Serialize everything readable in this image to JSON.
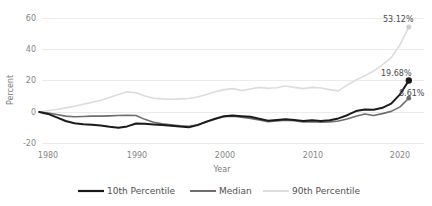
{
  "chart_data": {
    "type": "line",
    "title": "",
    "xlabel": "Year",
    "ylabel": "Percent",
    "xlim": [
      1979,
      2022
    ],
    "ylim": [
      -20,
      60
    ],
    "xticks": [
      1980,
      1990,
      2000,
      2010,
      2020
    ],
    "yticks": [
      -20,
      0,
      20,
      40,
      60
    ],
    "grid": true,
    "legend_position": "bottom",
    "x": [
      1979,
      1980,
      1981,
      1982,
      1983,
      1984,
      1985,
      1986,
      1987,
      1988,
      1989,
      1990,
      1991,
      1992,
      1993,
      1994,
      1995,
      1996,
      1997,
      1998,
      1999,
      2000,
      2001,
      2002,
      2003,
      2004,
      2005,
      2006,
      2007,
      2008,
      2009,
      2010,
      2011,
      2012,
      2013,
      2014,
      2015,
      2016,
      2017,
      2018,
      2019,
      2020,
      2021
    ],
    "series": [
      {
        "name": "10th Percentile",
        "color": "#1a1a1a",
        "width": 2.0,
        "end_label": "19.68%",
        "end_value": 19.68,
        "values": [
          0.0,
          -1.2,
          -3.4,
          -5.6,
          -7.0,
          -7.6,
          -8.0,
          -8.4,
          -9.2,
          -9.8,
          -9.0,
          -7.2,
          -7.4,
          -7.8,
          -8.2,
          -8.6,
          -9.0,
          -9.6,
          -8.2,
          -6.0,
          -4.2,
          -2.6,
          -2.2,
          -2.6,
          -3.0,
          -4.2,
          -5.4,
          -5.0,
          -4.6,
          -5.0,
          -5.6,
          -5.2,
          -5.6,
          -5.2,
          -4.0,
          -2.0,
          0.6,
          1.6,
          1.4,
          2.6,
          5.2,
          11.0,
          19.68
        ]
      },
      {
        "name": "Median",
        "color": "#6e6e6e",
        "width": 1.6,
        "end_label": "8.61%",
        "end_value": 8.61,
        "values": [
          0.0,
          -0.6,
          -1.6,
          -2.6,
          -3.0,
          -2.8,
          -2.6,
          -2.6,
          -2.4,
          -2.2,
          -2.0,
          -2.2,
          -4.6,
          -6.4,
          -7.4,
          -8.0,
          -8.6,
          -9.0,
          -8.0,
          -6.2,
          -4.4,
          -3.0,
          -2.6,
          -3.2,
          -4.0,
          -5.0,
          -6.0,
          -5.6,
          -5.2,
          -5.4,
          -6.2,
          -6.0,
          -6.4,
          -6.2,
          -5.6,
          -4.4,
          -2.6,
          -1.2,
          -2.2,
          -1.0,
          0.4,
          3.2,
          8.61
        ]
      },
      {
        "name": "90th Percentile",
        "color": "#dcdcdc",
        "width": 1.6,
        "end_label": "53.12%",
        "end_value": 53.12,
        "values": [
          0.0,
          0.8,
          1.6,
          2.6,
          3.6,
          4.8,
          6.0,
          7.4,
          9.0,
          11.0,
          12.6,
          12.0,
          10.0,
          8.6,
          8.2,
          8.0,
          8.2,
          8.4,
          9.4,
          11.0,
          12.6,
          14.0,
          14.6,
          13.4,
          14.4,
          15.4,
          14.8,
          15.2,
          16.2,
          15.4,
          14.6,
          15.4,
          15.0,
          14.0,
          13.2,
          16.8,
          20.0,
          22.6,
          25.6,
          29.4,
          34.0,
          42.0,
          53.12
        ]
      }
    ]
  },
  "legend": {
    "items": [
      {
        "label": "10th Percentile",
        "color": "#1a1a1a"
      },
      {
        "label": "Median",
        "color": "#6e6e6e"
      },
      {
        "label": "90th Percentile",
        "color": "#dcdcdc"
      }
    ]
  },
  "axis": {
    "y_title": "Percent",
    "x_title": "Year",
    "y_tick_labels": [
      "60",
      "40",
      "20",
      "0",
      "-20"
    ],
    "x_tick_labels": [
      "1980",
      "1990",
      "2000",
      "2010",
      "2020"
    ]
  },
  "annotations": {
    "p90_label": "53.12%",
    "p10_label": "19.68%",
    "median_label": "8.61%"
  }
}
